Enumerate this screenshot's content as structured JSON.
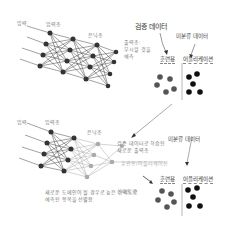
{
  "top_network": {
    "labels": {
      "input": "입력",
      "input_layer": "입력층",
      "hidden_layer": "은닉층",
      "output_layer_note": [
        "출력층:",
        "무시할 것을",
        "예측"
      ]
    }
  },
  "validation_data_label": "검증 데이터",
  "unclassified_data_label_top": "미분류 데이터",
  "top_groups": {
    "training_header": "훈련용",
    "application_header": "어플리케이션",
    "training_dots_color": "#555555",
    "application_dots_color": "#111111"
  },
  "bottom_network": {
    "labels": {
      "input": "입력",
      "input_layer": "입력층",
      "hidden_layer": "은닉층",
      "new_output_note": [
        "검증 데이터로 학습된",
        "새로운 출력층"
      ],
      "new_output_sub": "훈련용/어플리케이션",
      "confidence": "신뢰도로",
      "bottom_note": [
        "새로운 도메인이 될 경우로 높은 신뢰도로",
        "예측된 항목을 선별함"
      ]
    }
  },
  "unclassified_data_label_bottom": "미분류 데이터",
  "bottom_groups": {
    "training_header": "훈련용",
    "application_header": "어플리케이션"
  }
}
